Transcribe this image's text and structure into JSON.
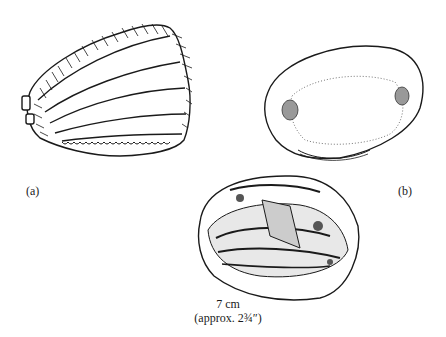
{
  "figure": {
    "panels": [
      {
        "id": "a",
        "label": "(a)",
        "description": "external view of clam shell valve with concentric growth ridges"
      },
      {
        "id": "b",
        "label": "(b)",
        "description": "interior view of single valve showing muscle scars"
      }
    ],
    "scale": {
      "metric": "7 cm",
      "imperial": "(approx. 2¾″)"
    }
  }
}
